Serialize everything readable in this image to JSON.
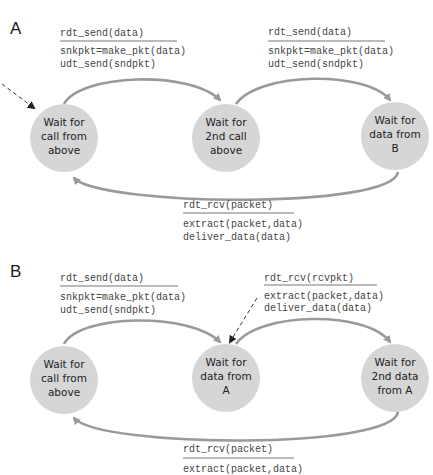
{
  "panels": {
    "A": {
      "label": "A",
      "states": [
        {
          "lines": [
            "Wait for",
            "call from",
            "above"
          ]
        },
        {
          "lines": [
            "Wait for",
            "2nd call",
            "above"
          ]
        },
        {
          "lines": [
            "Wait for",
            "data from",
            "B"
          ]
        }
      ],
      "transitions": [
        {
          "event": "rdt_send(data)",
          "actions": [
            "snkpkt=make_pkt(data)",
            "udt_send(sndpkt)"
          ]
        },
        {
          "event": "rdt_send(data)",
          "actions": [
            "snkpkt=make_pkt(data)",
            "udt_send(sndpkt)"
          ]
        },
        {
          "event": "rdt_rcv(packet)",
          "actions": [
            "extract(packet,data)",
            "deliver_data(data)"
          ]
        }
      ]
    },
    "B": {
      "label": "B",
      "states": [
        {
          "lines": [
            "Wait for",
            "call from",
            "above"
          ]
        },
        {
          "lines": [
            "Wait for",
            "data from",
            "A"
          ]
        },
        {
          "lines": [
            "Wait for",
            "2nd data",
            "from A"
          ]
        }
      ],
      "transitions": [
        {
          "event": "rdt_send(data)",
          "actions": [
            "snkpkt=make_pkt(data)",
            "udt_send(sndpkt)"
          ]
        },
        {
          "event": "rdt_rcv(rcvpkt)",
          "actions": [
            "extract(packet,data)",
            "deliver_data(data)"
          ]
        },
        {
          "event": "rdt_rcv(packet)",
          "actions": [
            "extract(packet,data)"
          ]
        }
      ]
    }
  },
  "colors": {
    "state_fill": "#d6d6d6",
    "arc_stroke": "#9a9a9a",
    "text": "#222222"
  }
}
